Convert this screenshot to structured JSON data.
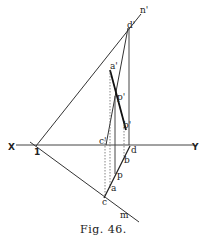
{
  "figure": {
    "caption": "Fig. 46.",
    "ground_line": {
      "left_label": "X",
      "right_label": "Y"
    },
    "labels": {
      "n_prime": "n'",
      "d_prime": "d'",
      "a_prime": "a'",
      "p_prime": "p'",
      "b_prime": "b'",
      "c_prime": "c'",
      "d": "d",
      "b": "b",
      "p": "p",
      "a": "a",
      "c": "c",
      "m": "m",
      "one": "1"
    },
    "colors": {
      "ink": "#222222",
      "background": "#ffffff"
    }
  }
}
